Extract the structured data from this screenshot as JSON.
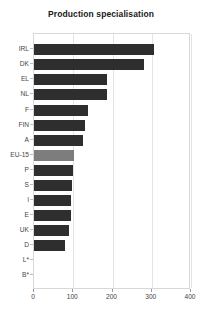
{
  "chart_data": {
    "type": "bar",
    "orientation": "horizontal",
    "title": "Production specialisation",
    "xlabel": "",
    "ylabel": "",
    "xlim": [
      0,
      400
    ],
    "xticks": [
      0,
      100,
      200,
      300,
      400
    ],
    "grid": true,
    "grid_axis": "x",
    "legend": null,
    "categories": [
      "IRL",
      "DK",
      "EL",
      "NL",
      "F",
      "FIN",
      "A",
      "EU-15",
      "P",
      "S",
      "I",
      "E",
      "UK",
      "D",
      "L*",
      "B*"
    ],
    "values": [
      305,
      281,
      186,
      185,
      138,
      131,
      126,
      103,
      100,
      98,
      95,
      93,
      90,
      78,
      0,
      0
    ],
    "highlight_category": "EU-15",
    "colors": {
      "bar": "#2e2e2e",
      "bar_highlight": "#7d7d7d",
      "plot_border": "#d8d8d8",
      "gridline": "#e4e4e4",
      "text": "#444444",
      "title": "#1a1a1a",
      "background": "#ffffff"
    }
  }
}
